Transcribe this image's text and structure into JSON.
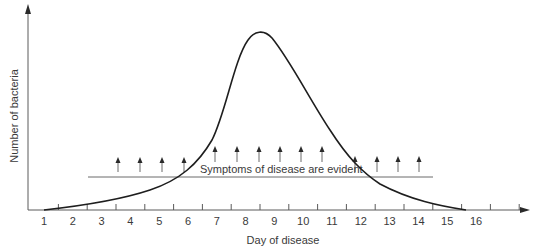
{
  "chart_data": {
    "type": "line",
    "title": "",
    "xlabel": "Day of disease",
    "ylabel": "Number of bacteria",
    "x_ticks": [
      "1",
      "2",
      "3",
      "4",
      "5",
      "6",
      "7",
      "8",
      "9",
      "10",
      "11",
      "12",
      "13",
      "14",
      "15",
      "16"
    ],
    "xlim": [
      0.5,
      17
    ],
    "grid": false,
    "legend": null,
    "series": [
      {
        "name": "Number of bacteria (relative)",
        "x": [
          1,
          2,
          3,
          4,
          5,
          6,
          7,
          7.5,
          8,
          8.3,
          8.6,
          9,
          9.5,
          10,
          11,
          12,
          13,
          14,
          15,
          16
        ],
        "y": [
          0,
          2,
          6,
          12,
          20,
          32,
          60,
          80,
          95,
          100,
          98,
          90,
          75,
          60,
          35,
          20,
          12,
          6,
          2,
          0
        ]
      }
    ],
    "annotations": [
      {
        "text": "Symptoms of disease are evident",
        "span_days": [
          2.6,
          14.1
        ],
        "description": "Horizontal bar with upward arrows marking the period when symptoms of disease are evident"
      }
    ],
    "colors": {
      "axis": "#5a5a5a",
      "curve": "#1e1e1e",
      "text": "#3a3a3a"
    }
  }
}
